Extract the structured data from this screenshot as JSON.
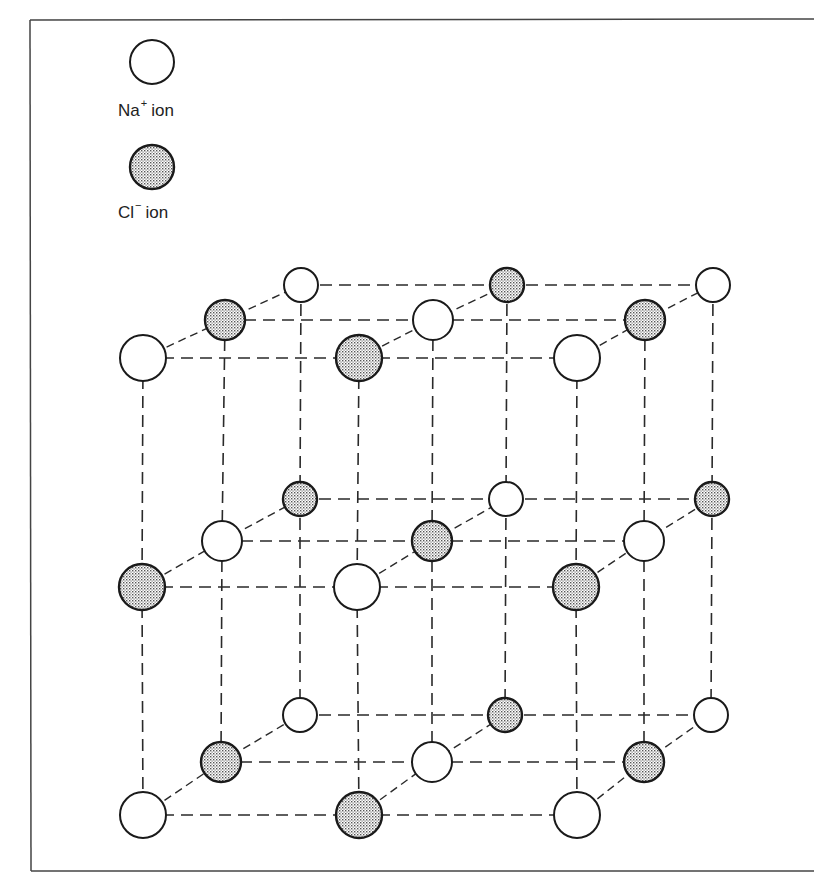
{
  "diagram": {
    "colors": {
      "stroke": "#1a1a1a",
      "frame": "#444444",
      "background": "#ffffff",
      "chloride_fill": "#cfcfcf"
    },
    "legend": [
      {
        "ion": "Na",
        "charge": "+",
        "suffix": "ion",
        "style": "open"
      },
      {
        "ion": "Cl",
        "charge": "−",
        "suffix": "ion",
        "style": "stippled"
      }
    ],
    "lattice": {
      "layers": [
        {
          "name": "back",
          "radius": 17,
          "rows": [
            {
              "y": 285,
              "atoms": [
                {
                  "x": 301,
                  "type": "Na"
                },
                {
                  "x": 507,
                  "type": "Cl"
                },
                {
                  "x": 713,
                  "type": "Na"
                }
              ]
            },
            {
              "y": 499,
              "atoms": [
                {
                  "x": 300,
                  "type": "Cl"
                },
                {
                  "x": 506,
                  "type": "Na"
                },
                {
                  "x": 712,
                  "type": "Cl"
                }
              ]
            },
            {
              "y": 715,
              "atoms": [
                {
                  "x": 300,
                  "type": "Na"
                },
                {
                  "x": 505,
                  "type": "Cl"
                },
                {
                  "x": 711,
                  "type": "Na"
                }
              ]
            }
          ]
        },
        {
          "name": "middle",
          "radius": 20,
          "rows": [
            {
              "y": 320,
              "atoms": [
                {
                  "x": 225,
                  "type": "Cl"
                },
                {
                  "x": 433,
                  "type": "Na"
                },
                {
                  "x": 645,
                  "type": "Cl"
                }
              ]
            },
            {
              "y": 541,
              "atoms": [
                {
                  "x": 222,
                  "type": "Na"
                },
                {
                  "x": 432,
                  "type": "Cl"
                },
                {
                  "x": 644,
                  "type": "Na"
                }
              ]
            },
            {
              "y": 762,
              "atoms": [
                {
                  "x": 221,
                  "type": "Cl"
                },
                {
                  "x": 432,
                  "type": "Na"
                },
                {
                  "x": 644,
                  "type": "Cl"
                }
              ]
            }
          ]
        },
        {
          "name": "front",
          "radius": 23,
          "rows": [
            {
              "y": 358,
              "atoms": [
                {
                  "x": 143,
                  "type": "Na"
                },
                {
                  "x": 359,
                  "type": "Cl"
                },
                {
                  "x": 577,
                  "type": "Na"
                }
              ]
            },
            {
              "y": 587,
              "atoms": [
                {
                  "x": 142,
                  "type": "Cl"
                },
                {
                  "x": 357,
                  "type": "Na"
                },
                {
                  "x": 576,
                  "type": "Cl"
                }
              ]
            },
            {
              "y": 815,
              "atoms": [
                {
                  "x": 143,
                  "type": "Na"
                },
                {
                  "x": 359,
                  "type": "Cl"
                },
                {
                  "x": 577,
                  "type": "Na"
                }
              ]
            }
          ]
        }
      ]
    }
  }
}
